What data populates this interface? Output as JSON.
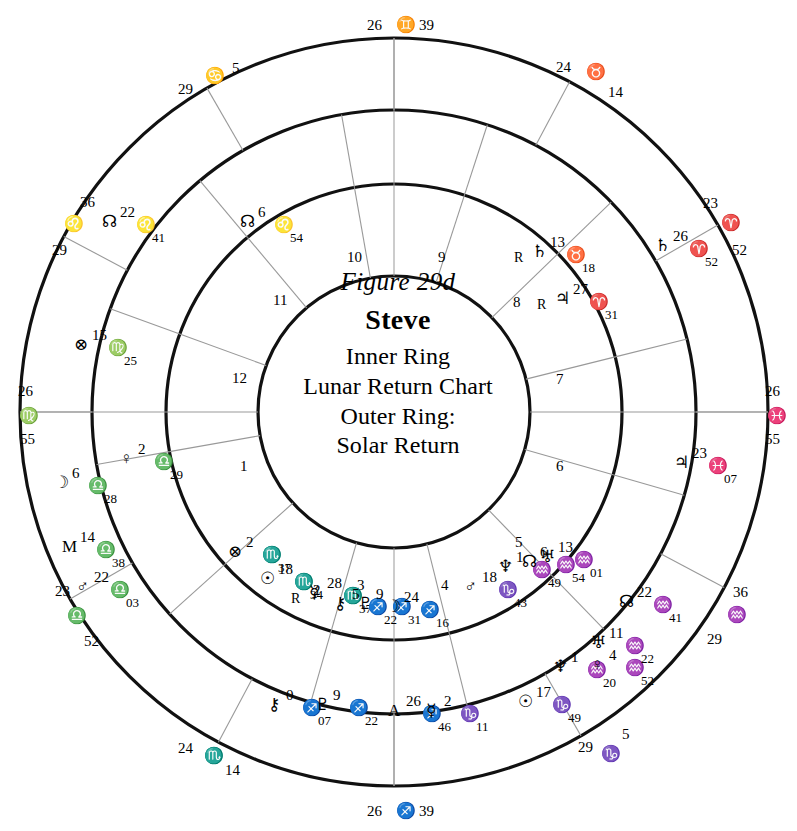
{
  "center": {
    "figure": "Figure 29d",
    "name": "Steve",
    "line1": "Inner Ring",
    "line2": "Lunar Return Chart",
    "line3": "Outer Ring:",
    "line4": "Solar Return"
  },
  "colors": {
    "ink": "#111111",
    "ring_stroke": "#111111",
    "spoke_stroke": "#999999"
  },
  "houses": [
    {
      "num": "1",
      "x": 240,
      "y": 459
    },
    {
      "num": "2",
      "x": 313,
      "y": 583
    },
    {
      "num": "3",
      "x": 357,
      "y": 578
    },
    {
      "num": "4",
      "x": 441,
      "y": 578
    },
    {
      "num": "5",
      "x": 515,
      "y": 535
    },
    {
      "num": "6",
      "x": 556,
      "y": 459
    },
    {
      "num": "7",
      "x": 556,
      "y": 372
    },
    {
      "num": "8",
      "x": 513,
      "y": 295
    },
    {
      "num": "9",
      "x": 438,
      "y": 250
    },
    {
      "num": "10",
      "x": 347,
      "y": 250
    },
    {
      "num": "11",
      "x": 273,
      "y": 293
    },
    {
      "num": "12",
      "x": 232,
      "y": 371
    }
  ],
  "outer_cusps": [
    {
      "deg": "26",
      "sign": "♊",
      "min": "39",
      "dx": 367,
      "dy": 18,
      "sx": 396,
      "sy": 17,
      "mx": 419,
      "my": 18
    },
    {
      "deg": "24",
      "sign": "♉",
      "min": "14",
      "dx": 556,
      "dy": 60,
      "sx": 586,
      "sy": 64,
      "mx": 608,
      "my": 85
    },
    {
      "deg": "23",
      "sign": "♈",
      "min": "52",
      "dx": 703,
      "dy": 196,
      "sx": 721,
      "sy": 215,
      "mx": 732,
      "my": 243
    },
    {
      "deg": "26",
      "sign": "♓",
      "min": "55",
      "dx": 765,
      "dy": 384,
      "sx": 767,
      "sy": 408,
      "mx": 765,
      "my": 432
    },
    {
      "deg": "36",
      "sign": "♒",
      "min": "29",
      "dx": 733,
      "dy": 585,
      "sx": 727,
      "sy": 607,
      "mx": 707,
      "my": 632
    },
    {
      "deg": "29",
      "sign": "♑",
      "min": "5",
      "dx": 578,
      "dy": 740,
      "sx": 601,
      "sy": 746,
      "mx": 622,
      "my": 727
    },
    {
      "deg": "26",
      "sign": "♐",
      "min": "39",
      "dx": 367,
      "dy": 804,
      "sx": 396,
      "sy": 803,
      "mx": 419,
      "my": 804
    },
    {
      "deg": "24",
      "sign": "♏",
      "min": "14",
      "dx": 178,
      "dy": 741,
      "sx": 204,
      "sy": 748,
      "mx": 225,
      "my": 763
    },
    {
      "deg": "23",
      "sign": "♎",
      "min": "52",
      "dx": 55,
      "dy": 584,
      "sx": 67,
      "sy": 608,
      "mx": 84,
      "my": 634
    },
    {
      "deg": "26",
      "sign": "♍",
      "min": "55",
      "dx": 18,
      "dy": 384,
      "sx": 19,
      "sy": 408,
      "mx": 20,
      "my": 432
    },
    {
      "deg": "36",
      "sign": "♌",
      "min": "29",
      "dx": 80,
      "dy": 195,
      "sx": 64,
      "sy": 216,
      "mx": 52,
      "my": 243
    },
    {
      "deg": "29",
      "sign": "♋",
      "min": "5",
      "dx": 178,
      "dy": 82,
      "sx": 205,
      "sy": 68,
      "mx": 232,
      "my": 61
    }
  ],
  "outer_planets": [
    {
      "name": "north-node",
      "sym": "☊",
      "deg": "22",
      "sign": "♌",
      "min": "41",
      "retro": "",
      "x": 100,
      "y": 205,
      "layout": "a"
    },
    {
      "name": "fortune",
      "sym": "⊗",
      "deg": "15",
      "sign": "♍",
      "min": "25",
      "retro": "",
      "x": 72,
      "y": 328,
      "layout": "b"
    },
    {
      "name": "moon",
      "sym": "☽",
      "deg": "6",
      "sign": "♎",
      "min": "28",
      "retro": "",
      "x": 52,
      "y": 466,
      "layout": "b"
    },
    {
      "name": "midheaven",
      "sym": "M",
      "deg": "14",
      "sign": "♎",
      "min": "38",
      "retro": "",
      "x": 60,
      "y": 530,
      "layout": "c"
    },
    {
      "name": "mars",
      "sym": "♂",
      "deg": "22",
      "sign": "♎",
      "min": "03",
      "retro": "",
      "x": 74,
      "y": 570,
      "layout": "c"
    },
    {
      "name": "chiron",
      "sym": "⚷",
      "deg": "0",
      "sign": "♐",
      "min": "07",
      "retro": "",
      "x": 266,
      "y": 688,
      "layout": "d"
    },
    {
      "name": "pluto",
      "sym": "♇",
      "deg": "9",
      "sign": "♐",
      "min": "22",
      "retro": "",
      "x": 313,
      "y": 688,
      "layout": "d"
    },
    {
      "name": "ascendant",
      "sym": "A",
      "deg": "26",
      "sign": "♐",
      "min": "46",
      "retro": "",
      "x": 386,
      "y": 694,
      "layout": "d"
    },
    {
      "name": "mercury",
      "sym": "☿",
      "deg": "2",
      "sign": "♑",
      "min": "11",
      "retro": "",
      "x": 424,
      "y": 694,
      "layout": "d"
    },
    {
      "name": "sun",
      "sym": "☉",
      "deg": "17",
      "sign": "♑",
      "min": "49",
      "retro": "",
      "x": 516,
      "y": 685,
      "layout": "d"
    },
    {
      "name": "neptune",
      "sym": "♆",
      "deg": "1",
      "sign": "♒",
      "min": "20",
      "retro": "",
      "x": 551,
      "y": 650,
      "layout": "e"
    },
    {
      "name": "venus",
      "sym": "♀",
      "deg": "4",
      "sign": "♒",
      "min": "52",
      "retro": "",
      "x": 589,
      "y": 648,
      "layout": "e"
    },
    {
      "name": "uranus",
      "sym": "♅",
      "deg": "11",
      "sign": "♒",
      "min": "22",
      "retro": "",
      "x": 589,
      "y": 626,
      "layout": "f"
    },
    {
      "name": "north-node-2",
      "sym": "☊",
      "deg": "22",
      "sign": "♒",
      "min": "41",
      "retro": "",
      "x": 617,
      "y": 585,
      "layout": "f"
    },
    {
      "name": "jupiter",
      "sym": "♃",
      "deg": "23",
      "sign": "♓",
      "min": "07",
      "retro": "",
      "x": 672,
      "y": 446,
      "layout": "g"
    },
    {
      "name": "saturn",
      "sym": "♄",
      "deg": "26",
      "sign": "♈",
      "min": "52",
      "retro": "",
      "x": 653,
      "y": 229,
      "layout": "h"
    },
    {
      "name": "jupiter-2",
      "sym": "♃",
      "deg": "27",
      "sign": "♈",
      "min": "31",
      "retro": "R",
      "x": 553,
      "y": 282,
      "layout": "i"
    }
  ],
  "inner_planets": [
    {
      "name": "north-node",
      "sym": "☊",
      "deg": "6",
      "sign": "♌",
      "min": "54",
      "retro": "",
      "x": 238,
      "y": 205
    },
    {
      "name": "venus",
      "sym": "♀",
      "deg": "2",
      "sign": "♎",
      "min": "29",
      "retro": "",
      "x": 118,
      "y": 442
    },
    {
      "name": "fortune",
      "sym": "⊗",
      "deg": "2",
      "sign": "♏",
      "min": "37",
      "retro": "",
      "x": 226,
      "y": 535
    },
    {
      "name": "sun",
      "sym": "☉",
      "deg": "18",
      "sign": "♏",
      "min": "34",
      "retro": "",
      "x": 258,
      "y": 562
    },
    {
      "name": "mercury",
      "sym": "☿",
      "deg": "28",
      "sign": "♏",
      "min": "37",
      "retro": "R",
      "x": 307,
      "y": 576
    },
    {
      "name": "chiron",
      "sym": "⚷",
      "deg": "5",
      "sign": "♐",
      "min": "22",
      "retro": "",
      "x": 332,
      "y": 587
    },
    {
      "name": "pluto",
      "sym": "♇",
      "deg": "9",
      "sign": "♐",
      "min": "31",
      "retro": "",
      "x": 356,
      "y": 587
    },
    {
      "name": "moon",
      "sym": "☽",
      "deg": "24",
      "sign": "♐",
      "min": "16",
      "retro": "",
      "x": 384,
      "y": 590
    },
    {
      "name": "mars",
      "sym": "♂",
      "deg": "18",
      "sign": "♑",
      "min": "43",
      "retro": "",
      "x": 462,
      "y": 570
    },
    {
      "name": "neptune",
      "sym": "♆",
      "deg": "1",
      "sign": "♒",
      "min": "49",
      "retro": "",
      "x": 496,
      "y": 550
    },
    {
      "name": "north-node-2",
      "sym": "☊",
      "deg": "6",
      "sign": "♒",
      "min": "54",
      "retro": "",
      "x": 520,
      "y": 545
    },
    {
      "name": "uranus",
      "sym": "♅",
      "deg": "13",
      "sign": "♒",
      "min": "01",
      "retro": "",
      "x": 538,
      "y": 540
    },
    {
      "name": "saturn",
      "sym": "♄",
      "deg": "13",
      "sign": "♉",
      "min": "18",
      "retro": "R",
      "x": 530,
      "y": 235
    }
  ],
  "geometry": {
    "cx": 394,
    "cy": 412,
    "r_outer": 374,
    "r_mid": 302,
    "r_inner": 228,
    "r_core": 136,
    "outer_spoke_angles": [
      90,
      120,
      152,
      180,
      210,
      242,
      270,
      300,
      332,
      0,
      30,
      62
    ],
    "inner_spoke_angles": [
      100,
      130,
      160,
      190,
      222,
      254,
      284,
      314,
      344,
      14,
      44,
      72
    ]
  }
}
